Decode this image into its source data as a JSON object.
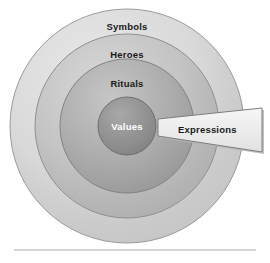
{
  "figure": {
    "background_color": "#ffffff",
    "center": {
      "x": 127,
      "y": 126
    },
    "rings": [
      {
        "name": "symbols",
        "label": "Symbols",
        "radius": 117,
        "fill": "#d4d4d4",
        "stroke": "#9a9a9a",
        "label_color": "#1a1a1a",
        "label_x": 127,
        "label_y": 22
      },
      {
        "name": "heroes",
        "label": "Heroes",
        "radius": 92,
        "fill": "#bdbdbd",
        "stroke": "#8f8f8f",
        "label_color": "#1a1a1a",
        "label_x": 127,
        "label_y": 50
      },
      {
        "name": "rituals",
        "label": "Rituals",
        "radius": 67,
        "fill": "#a6a6a6",
        "stroke": "#828282",
        "label_color": "#1a1a1a",
        "label_x": 127,
        "label_y": 79
      },
      {
        "name": "values",
        "label": "Values",
        "radius": 29,
        "fill": "#8a8a8a",
        "stroke": "#6f6f6f",
        "label_color": "#ffffff",
        "label_x": 127,
        "label_y": 122
      }
    ],
    "callout": {
      "label": "Expressions",
      "fill": "#eeeeee",
      "stroke": "#7d7d7d",
      "shadow_color": "#b5b5b5",
      "label_color": "#1a1a1a",
      "label_x": 178,
      "label_y": 125,
      "points": "158,119 262,108 262,152 158,136"
    },
    "divider": {
      "name": "bottom-divider",
      "color": "#b0b0b0",
      "x1": 14,
      "x2": 256,
      "y": 250
    }
  }
}
